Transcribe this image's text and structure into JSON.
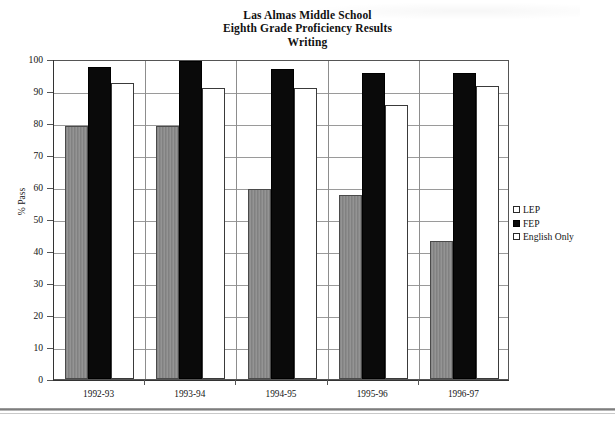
{
  "chart_data": {
    "type": "bar",
    "title": "Las Almas Middle School\nEighth Grade Proficiency Results\nWriting",
    "title_lines": [
      "Las Almas Middle School",
      "Eighth Grade Proficiency Results",
      "Writing"
    ],
    "xlabel": "",
    "ylabel": "% Pass",
    "ylim": [
      0,
      100
    ],
    "ytick_step": 10,
    "yticks": [
      0,
      10,
      20,
      30,
      40,
      50,
      60,
      70,
      80,
      90,
      100
    ],
    "grid": true,
    "legend_position": "right",
    "categories": [
      "1992-93",
      "1993-94",
      "1994-95",
      "1995-96",
      "1996-97"
    ],
    "series": [
      {
        "name": "LEP",
        "color": "#8a8a8a",
        "values": [
          79,
          79,
          59.5,
          57.5,
          43
        ]
      },
      {
        "name": "FEP",
        "color": "#0a0a0a",
        "values": [
          97.5,
          99.5,
          97,
          95.5,
          95.5
        ]
      },
      {
        "name": "English Only",
        "color": "#ffffff",
        "values": [
          92.5,
          91,
          91,
          85.5,
          91.5
        ]
      }
    ]
  },
  "legend": {
    "items": [
      {
        "label": "LEP"
      },
      {
        "label": "FEP"
      },
      {
        "label": "English Only"
      }
    ]
  }
}
